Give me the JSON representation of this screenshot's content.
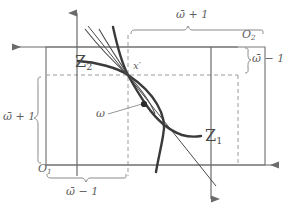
{
  "figure": {
    "colors": {
      "curve": "#3a3a3a",
      "axis": "#6b6b6b",
      "box": "#7a7a7a",
      "dashed": "#9a9a9a",
      "brace": "#8a8a8a",
      "label": "#5e5e5e",
      "background": "#ffffff"
    }
  },
  "labels": {
    "origin_1": "O",
    "origin_1_sub": "1",
    "origin_2": "O",
    "origin_2_sub": "2",
    "curve_1": "Z",
    "curve_1_sub": "1",
    "curve_2": "Z",
    "curve_2_sub": "2",
    "point_x_prime": "x′",
    "point_omega": "ω",
    "brace_top": "ω̄ + 1",
    "brace_right": "ω̄ − 1",
    "brace_left": "ω̄ + 1",
    "brace_bottom": "ω̄ − 1"
  },
  "geometry": {
    "intersection_point": {
      "x": 128,
      "y": 75
    },
    "omega_dot": {
      "x": 144,
      "y": 104
    },
    "solid_box": {
      "x1": 46,
      "y1": 47,
      "x2": 265,
      "y2": 165
    },
    "dashed_box": {
      "x1": 46,
      "y1": 75,
      "x2": 238,
      "y2": 165
    },
    "axis_1_origin": {
      "x": 46,
      "y": 165
    },
    "axis_2_origin": {
      "x": 238,
      "y": 47
    }
  }
}
